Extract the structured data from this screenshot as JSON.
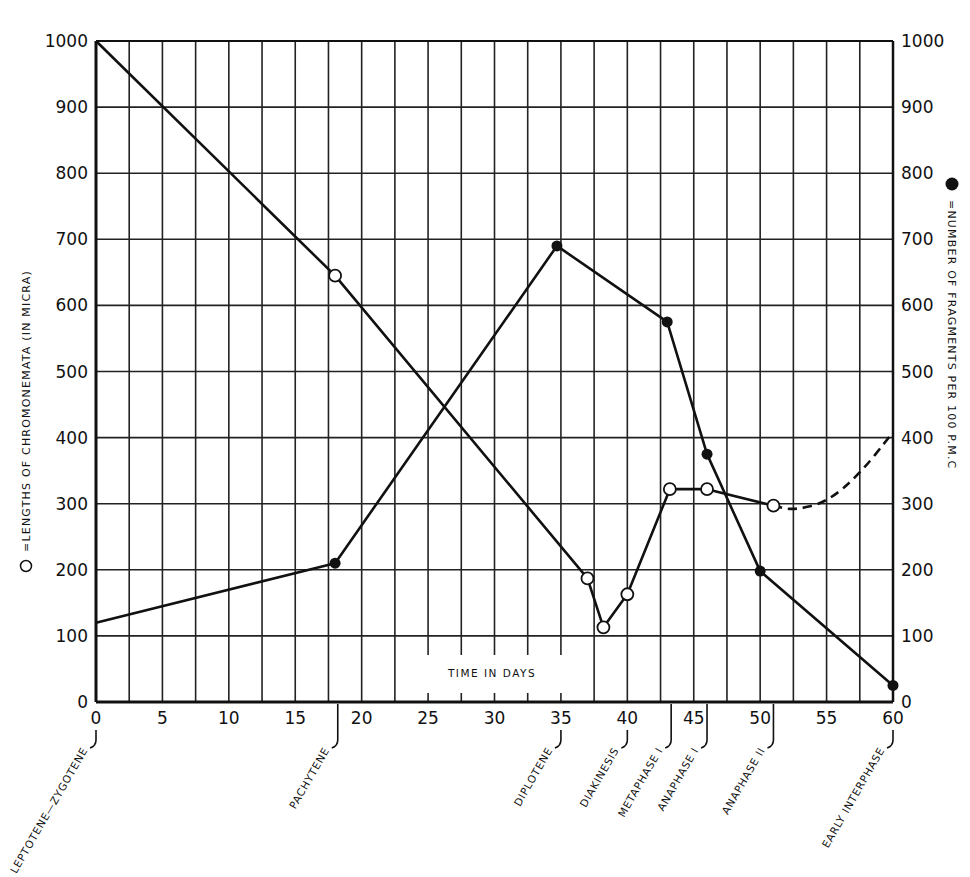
{
  "chart_data": {
    "type": "line",
    "title": "",
    "xlabel": "TIME IN DAYS",
    "ylabel_left": "=LENGTHS OF CHROMONEMATA (IN MICRA)",
    "ylabel_left_marker": "open-circle",
    "ylabel_right": "=NUMBER OF FRAGMENTS PER 100 P.M.C",
    "ylabel_right_marker": "filled-circle",
    "xlim": [
      0,
      60
    ],
    "ylim_left": [
      0,
      1000
    ],
    "ylim_right": [
      0,
      1000
    ],
    "x_ticks": [
      0,
      5,
      10,
      15,
      20,
      25,
      30,
      35,
      40,
      45,
      50,
      55,
      60
    ],
    "y_ticks": [
      0,
      100,
      200,
      300,
      400,
      500,
      600,
      700,
      800,
      900,
      1000
    ],
    "grid": true,
    "grid_x_step": 5,
    "grid_y_step": 100,
    "series": [
      {
        "name": "Lengths of chromonemata (in micra)",
        "marker": "open-circle",
        "axis": "left",
        "points": [
          {
            "x": 0,
            "y": 1000,
            "marker": false
          },
          {
            "x": 18,
            "y": 645,
            "marker": true
          },
          {
            "x": 37,
            "y": 187,
            "marker": true
          },
          {
            "x": 38.2,
            "y": 113,
            "marker": true
          },
          {
            "x": 40,
            "y": 163,
            "marker": true
          },
          {
            "x": 43.2,
            "y": 322,
            "marker": true
          },
          {
            "x": 46,
            "y": 322,
            "marker": true
          },
          {
            "x": 51,
            "y": 297,
            "marker": true
          }
        ],
        "dashed_extension": [
          {
            "x": 51,
            "y": 297
          },
          {
            "x": 52.5,
            "y": 290
          },
          {
            "x": 55,
            "y": 302
          },
          {
            "x": 57.5,
            "y": 345
          },
          {
            "x": 60,
            "y": 408
          }
        ]
      },
      {
        "name": "Number of fragments per 100 P.M.C",
        "marker": "filled-circle",
        "axis": "right",
        "points": [
          {
            "x": 0,
            "y": 120,
            "marker": false
          },
          {
            "x": 18,
            "y": 210,
            "marker": true
          },
          {
            "x": 34.7,
            "y": 690,
            "marker": true
          },
          {
            "x": 43,
            "y": 575,
            "marker": true
          },
          {
            "x": 46,
            "y": 375,
            "marker": true
          },
          {
            "x": 50,
            "y": 198,
            "marker": true
          },
          {
            "x": 60,
            "y": 25,
            "marker": true
          }
        ]
      }
    ],
    "stages": [
      {
        "label": "LEPTOTENE—ZYGOTENE",
        "x": 0
      },
      {
        "label": "PACHYTENE",
        "x": 18.2
      },
      {
        "label": "DIPLOTENE",
        "x": 35
      },
      {
        "label": "DIAKINESIS",
        "x": 40
      },
      {
        "label": "METAPHASE I",
        "x": 43.3
      },
      {
        "label": "ANAPHASE I",
        "x": 46
      },
      {
        "label": "ANAPHASE II",
        "x": 51
      },
      {
        "label": "EARLY INTERPHASE",
        "x": 60
      }
    ]
  },
  "colors": {
    "ink": "#111111",
    "background": "#ffffff",
    "grid": "#222222"
  }
}
